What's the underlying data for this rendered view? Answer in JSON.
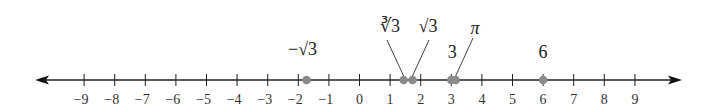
{
  "chart_data": {
    "type": "number-line",
    "xlim": [
      -9,
      9
    ],
    "ticks": [
      -9,
      -8,
      -7,
      -6,
      -5,
      -4,
      -3,
      -2,
      -1,
      0,
      1,
      2,
      3,
      4,
      5,
      6,
      7,
      8,
      9
    ],
    "tick_labels": [
      "−9",
      "−8",
      "−7",
      "−6",
      "−5",
      "−4",
      "−3",
      "−2",
      "−1",
      "0",
      "1",
      "2",
      "3",
      "4",
      "5",
      "6",
      "7",
      "8",
      "9"
    ],
    "arrows": "both-ends",
    "points": [
      {
        "label": "−√3",
        "value": -1.732,
        "leader": false
      },
      {
        "label": "∛3",
        "value": 1.442,
        "leader": true
      },
      {
        "label": "√3",
        "value": 1.732,
        "leader": true
      },
      {
        "label": "3",
        "value": 3,
        "leader": false
      },
      {
        "label": "π",
        "value": 3.14159,
        "leader": true,
        "italic": true
      },
      {
        "label": "6",
        "value": 6,
        "leader": false
      }
    ],
    "point_color": "#8a8a8a",
    "line_color": "#222222"
  }
}
